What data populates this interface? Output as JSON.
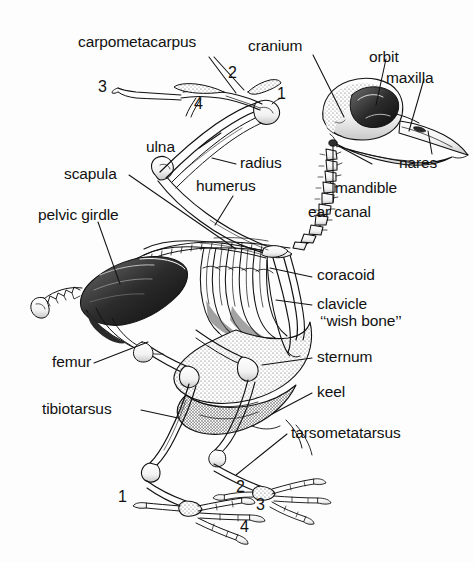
{
  "figure": {
    "style": "pen-and-ink line drawing with stippled shading",
    "background_color": "#fdfdfd",
    "ink_color": "#111111"
  },
  "labels": {
    "carpometacarpus": "carpometacarpus",
    "cranium": "cranium",
    "orbit": "orbit",
    "maxilla": "maxilla",
    "nares": "nares",
    "mandible": "mandible",
    "ear_canal": "ear canal",
    "ulna": "ulna",
    "radius": "radius",
    "humerus": "humerus",
    "scapula": "scapula",
    "pelvic_girdle": "pelvic girdle",
    "coracoid": "coracoid",
    "clavicle": "clavicle",
    "wish_bone": "‘‘wish bone’’",
    "sternum": "sternum",
    "keel": "keel",
    "femur": "femur",
    "tibiotarsus": "tibiotarsus",
    "tarsometatarsus": "tarsometatarsus"
  },
  "wing_digits": {
    "d1": "1",
    "d2": "2",
    "d3": "3",
    "d4": "4"
  },
  "toe_digits": {
    "t1": "1",
    "t2": "2",
    "t3": "3",
    "t4": "4"
  }
}
